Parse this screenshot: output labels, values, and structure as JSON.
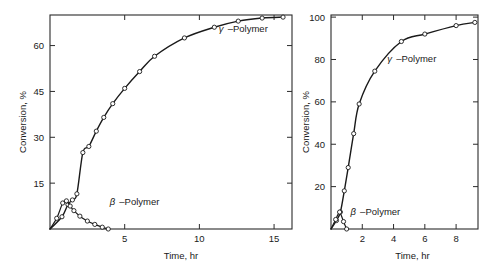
{
  "figure": {
    "background": "#ffffff",
    "ink_color": "#1a1a1a",
    "marker_fill": "#ffffff"
  },
  "chart_data": [
    {
      "id": "left-panel",
      "type": "line",
      "title": "",
      "xlabel": "Time, hr",
      "ylabel": "Conversion, %",
      "xlim": [
        0,
        16.2
      ],
      "ylim": [
        0,
        70
      ],
      "xticks": [
        5,
        10,
        15
      ],
      "xticklabels": [
        "5",
        "10",
        "15"
      ],
      "yticks": [
        15,
        30,
        45,
        60
      ],
      "yticklabels": [
        "15",
        "30",
        "45",
        "60"
      ],
      "grid": false,
      "legend_position": "inline-annotation",
      "series": [
        {
          "name": "γ –Polymer",
          "label_greek": "γ",
          "label_text": "–Polymer",
          "label_x": 11.3,
          "label_y": 64.5,
          "markers": true,
          "x": [
            0.0,
            0.8,
            1.2,
            1.5,
            1.8,
            2.2,
            2.6,
            3.1,
            3.6,
            4.2,
            5.0,
            6.0,
            7.0,
            9.0,
            11.0,
            12.6,
            14.2,
            15.6
          ],
          "y": [
            0.0,
            4.0,
            8.0,
            9.5,
            11.5,
            25.0,
            27.0,
            32.0,
            36.5,
            41.0,
            46.0,
            51.5,
            56.5,
            62.5,
            66.0,
            68.0,
            69.0,
            69.3
          ]
        },
        {
          "name": "β –Polymer",
          "label_greek": "β",
          "label_text": "–Polymer",
          "label_x": 4.0,
          "label_y": 8.0,
          "markers": true,
          "x": [
            0.0,
            0.45,
            0.85,
            1.1,
            1.35,
            1.6,
            2.0,
            2.5,
            3.0,
            3.5,
            3.9
          ],
          "y": [
            0.0,
            3.5,
            8.5,
            9.2,
            7.5,
            6.0,
            4.2,
            2.6,
            1.5,
            0.6,
            0.0
          ]
        }
      ]
    },
    {
      "id": "right-panel",
      "type": "line",
      "title": "",
      "xlabel": "Time, hr",
      "ylabel": "Conversion, %",
      "xlim": [
        0,
        9.4
      ],
      "ylim": [
        0,
        101
      ],
      "xticks": [
        2,
        4,
        6,
        8
      ],
      "xticklabels": [
        "2",
        "4",
        "6",
        "8"
      ],
      "yticks": [
        20,
        40,
        60,
        80,
        100
      ],
      "yticklabels": [
        "20",
        "40",
        "60",
        "80",
        "100"
      ],
      "grid": false,
      "legend_position": "inline-annotation",
      "series": [
        {
          "name": "γ –Polymer",
          "label_greek": "γ",
          "label_text": "–Polymer",
          "label_x": 3.6,
          "label_y": 79.0,
          "markers": true,
          "x": [
            0.0,
            0.35,
            0.6,
            0.85,
            1.1,
            1.45,
            1.8,
            2.8,
            4.5,
            6.0,
            8.0,
            9.2
          ],
          "y": [
            0.0,
            4.0,
            8.0,
            18.0,
            29.0,
            45.0,
            59.0,
            74.5,
            88.5,
            92.0,
            96.0,
            97.5
          ]
        },
        {
          "name": "β –Polymer",
          "label_greek": "β",
          "label_text": "–Polymer",
          "label_x": 1.25,
          "label_y": 6.5,
          "markers": true,
          "x": [
            0.0,
            0.3,
            0.55,
            0.8,
            1.0
          ],
          "y": [
            0.0,
            4.5,
            8.0,
            3.5,
            0.0
          ]
        }
      ]
    }
  ]
}
